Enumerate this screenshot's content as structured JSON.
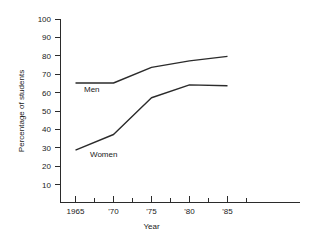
{
  "chart_data": {
    "type": "line",
    "title": "",
    "subtitle": "",
    "xlabel": "Year",
    "ylabel": "Percentage of students",
    "x": [
      1965,
      1970,
      1975,
      1980,
      1985
    ],
    "xtick_labels": [
      "1965",
      "'70",
      "'75",
      "'80",
      "'85"
    ],
    "ytick_labels": [
      "10",
      "20",
      "30",
      "40",
      "50",
      "60",
      "70",
      "80",
      "90",
      "100"
    ],
    "ytick_values": [
      10,
      20,
      30,
      40,
      50,
      60,
      70,
      80,
      90,
      100
    ],
    "xlim": [
      1965,
      1987
    ],
    "ylim": [
      0,
      100
    ],
    "grid": false,
    "legend_position": "inline-labels",
    "minor_xticks": true,
    "series": [
      {
        "name": "Men",
        "label": "Men",
        "values": [
          65,
          65,
          73.5,
          77,
          79.5
        ],
        "color": "#2b2b2b"
      },
      {
        "name": "Women",
        "label": "Women",
        "values": [
          28.5,
          37,
          57,
          64,
          63.5
        ],
        "color": "#2b2b2b"
      }
    ],
    "annotations": [
      {
        "text": "Men",
        "x": 1967.2,
        "y": 61.0
      },
      {
        "text": "Women",
        "x": 1968.6,
        "y": 25.0
      }
    ]
  },
  "axes": {
    "y_axis_title": "Percentage of students",
    "x_axis_title": "Year"
  }
}
